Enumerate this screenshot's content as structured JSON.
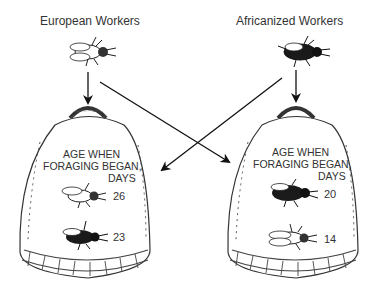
{
  "diagram": {
    "title_left": "European Workers",
    "title_right": "Africanized Workers",
    "hives": [
      {
        "name": "left-hive",
        "caption_line1": "AGE WHEN",
        "caption_line2": "FORAGING BEGAN,",
        "caption_line3": "DAYS",
        "entries": [
          {
            "bee": "european-bee",
            "value": "26"
          },
          {
            "bee": "africanized-bee",
            "value": "23"
          }
        ]
      },
      {
        "name": "right-hive",
        "caption_line1": "AGE WHEN",
        "caption_line2": "FORAGING BEGAN,",
        "caption_line3": "DAYS",
        "entries": [
          {
            "bee": "africanized-bee",
            "value": "20"
          },
          {
            "bee": "european-bee",
            "value": "14"
          }
        ]
      }
    ],
    "arrows": [
      {
        "from": "European Workers",
        "to": "left-hive"
      },
      {
        "from": "European Workers",
        "to": "right-hive"
      },
      {
        "from": "Africanized Workers",
        "to": "right-hive"
      },
      {
        "from": "Africanized Workers",
        "to": "left-hive"
      }
    ]
  }
}
